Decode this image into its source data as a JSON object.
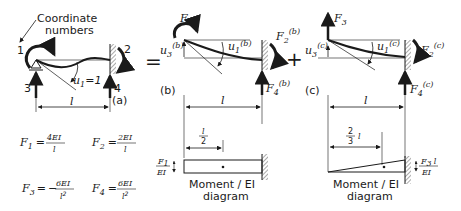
{
  "figure": {
    "callout": {
      "line1": "Coordinate",
      "line2": "numbers"
    },
    "operators": {
      "equals": "=",
      "plus": "+"
    },
    "panel_a": {
      "label": "(a)",
      "coord_1": "1",
      "coord_2": "2",
      "coord_3": "3",
      "coord_4": "4",
      "rotation_label": "u",
      "rotation_sub": "1",
      "rotation_value": "=1",
      "span": "l"
    },
    "panel_b": {
      "label": "(b)",
      "F1": "F",
      "F1_sub": "1",
      "F2": "F",
      "F2_sub": "2",
      "F2_sup": "(b)",
      "F4": "F",
      "F4_sub": "4",
      "F4_sup": "(b)",
      "u1": "u",
      "u1_sub": "1",
      "u1_sup": "(b)",
      "u3": "u",
      "u3_sub": "3",
      "u3_sup": "(b)",
      "span": "l",
      "diagram": {
        "dim_num": "l",
        "dim_den": "2",
        "ordinate_num": "F",
        "ordinate_num_sub": "1",
        "ordinate_den": "EI",
        "caption_line1": "Moment / EI",
        "caption_line2": "diagram"
      }
    },
    "panel_c": {
      "label": "(c)",
      "F3": "F",
      "F3_sub": "3",
      "F2": "F",
      "F2_sub": "2",
      "F2_sup": "(c)",
      "F4": "F",
      "F4_sub": "4",
      "F4_sup": "(c)",
      "u1": "u",
      "u1_sub": "1",
      "u1_sup": "(c)",
      "u3": "u",
      "u3_sub": "3",
      "u3_sup": "(c)",
      "span": "l",
      "diagram": {
        "dim_num": "2",
        "dim_den": "3",
        "dim_l": "l",
        "ordinate_num": "F",
        "ordinate_num_sub": "3",
        "ordinate_num_l": "l",
        "ordinate_den": "EI",
        "caption_line1": "Moment / EI",
        "caption_line2": "diagram"
      }
    },
    "equations": [
      {
        "lhs": "F",
        "sub": "1",
        "eq": "=",
        "sign": "",
        "num": "4EI",
        "den": "l",
        "den_exp": ""
      },
      {
        "lhs": "F",
        "sub": "2",
        "eq": "=",
        "sign": "",
        "num": "2EI",
        "den": "l",
        "den_exp": ""
      },
      {
        "lhs": "F",
        "sub": "3",
        "eq": "=",
        "sign": "−",
        "num": "6EI",
        "den": "l",
        "den_exp": "2"
      },
      {
        "lhs": "F",
        "sub": "4",
        "eq": "=",
        "sign": "",
        "num": "6EI",
        "den": "l",
        "den_exp": "2"
      }
    ]
  }
}
